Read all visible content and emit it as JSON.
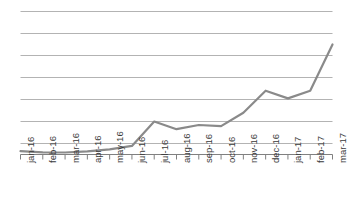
{
  "chart_data": {
    "type": "line",
    "title": "",
    "subtitle": "",
    "xlabel": "",
    "ylabel": "",
    "categories": [
      "jan-16",
      "feb-16",
      "mar-16",
      "apr-16",
      "may-16",
      "jun-16",
      "jul-16",
      "aug-16",
      "sep-16",
      "oct-16",
      "nov-16",
      "dec-16",
      "jan-17",
      "feb-17",
      "mar-17"
    ],
    "values": [
      6.5,
      6.0,
      5.9,
      6.4,
      7.3,
      8.9,
      20.0,
      16.5,
      18.4,
      17.9,
      24.0,
      34.0,
      30.5,
      34.0,
      55.0
    ],
    "series": [
      {
        "name": "series-1",
        "color": "#8a8a8a",
        "values": [
          6.5,
          6.0,
          5.9,
          6.4,
          7.3,
          8.9,
          20.0,
          16.5,
          18.4,
          17.9,
          24.0,
          34.0,
          30.5,
          34.0,
          55.0
        ]
      }
    ],
    "ylim": [
      0,
      70
    ],
    "xlim": [
      0,
      14
    ],
    "grid": true,
    "gridlines": [
      10,
      20,
      30,
      40,
      50,
      60,
      70
    ],
    "y_tick_labels": [],
    "legend": false,
    "legend_position": "none",
    "annotations": [],
    "colors": {
      "line": "#8a8a8a",
      "grid": "#b3b3b3",
      "axis": "#808080",
      "tick_label": "#3a3a3a",
      "background": "#ffffff"
    }
  }
}
